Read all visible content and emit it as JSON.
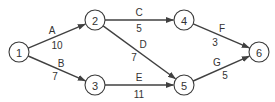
{
  "diagram": {
    "type": "network",
    "colors": {
      "line": "#404040",
      "text": "#333333",
      "background": "#ffffff"
    },
    "nodes": [
      {
        "id": "1",
        "label": "1",
        "x": 19,
        "y": 52
      },
      {
        "id": "2",
        "label": "2",
        "x": 95,
        "y": 20
      },
      {
        "id": "3",
        "label": "3",
        "x": 95,
        "y": 85
      },
      {
        "id": "4",
        "label": "4",
        "x": 184,
        "y": 20
      },
      {
        "id": "5",
        "label": "5",
        "x": 184,
        "y": 85
      },
      {
        "id": "6",
        "label": "6",
        "x": 259,
        "y": 52
      }
    ],
    "edges": [
      {
        "from": "1",
        "to": "2",
        "name": "A",
        "weight": "10",
        "name_pos": [
          52,
          30
        ],
        "weight_pos": [
          57,
          45
        ]
      },
      {
        "from": "1",
        "to": "3",
        "name": "B",
        "weight": "7",
        "name_pos": [
          61,
          63
        ],
        "weight_pos": [
          55,
          76
        ]
      },
      {
        "from": "2",
        "to": "4",
        "name": "C",
        "weight": "5",
        "name_pos": [
          139,
          12
        ],
        "weight_pos": [
          139,
          28
        ]
      },
      {
        "from": "2",
        "to": "5",
        "name": "D",
        "weight": "7",
        "name_pos": [
          143,
          44
        ],
        "weight_pos": [
          134,
          57
        ]
      },
      {
        "from": "3",
        "to": "5",
        "name": "E",
        "weight": "11",
        "name_pos": [
          139,
          77
        ],
        "weight_pos": [
          139,
          94
        ]
      },
      {
        "from": "4",
        "to": "6",
        "name": "F",
        "weight": "3",
        "name_pos": [
          222,
          28
        ],
        "weight_pos": [
          215,
          42
        ]
      },
      {
        "from": "5",
        "to": "6",
        "name": "G",
        "weight": "5",
        "name_pos": [
          217,
          62
        ],
        "weight_pos": [
          225,
          75
        ]
      }
    ]
  }
}
